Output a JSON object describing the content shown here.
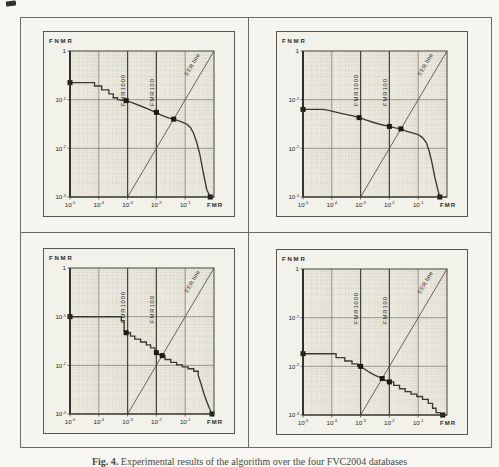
{
  "page": {
    "caption": {
      "label": "Fig. 4.",
      "text": "Experimental results of the algorithm over the four FVC2004 databases"
    }
  },
  "axes": {
    "ylabel": "FNMR",
    "xlabel": "FMR",
    "xscale": "log",
    "yscale": "log",
    "x_tick_exponents": [
      -5,
      -4,
      -3,
      -2,
      -1
    ],
    "y_tick_exponents": [
      0,
      -1,
      -2,
      -3
    ],
    "xlim_log": [
      -5,
      0
    ],
    "ylim_log": [
      -3,
      0
    ],
    "threshold_lines": [
      {
        "label": "FMR1000",
        "x_log": -3
      },
      {
        "label": "FMR100",
        "x_log": -2
      }
    ],
    "eer_label": "EER line",
    "grid": "log minor dotted, major solid",
    "colors": {
      "plot_bg": "#eae8dd",
      "frame_bg": "#f2f1ea",
      "minor_grid": "#b4b2a6",
      "major_grid": "#807e76",
      "threshold": "#45443e",
      "eer_line": "#55544c",
      "curve": "#3a3933",
      "marker": "#1b1a17",
      "axis": "#46453f",
      "axis_strong": "#2c2b27",
      "text": "#2c2b26"
    }
  },
  "chart_data": [
    {
      "name": "plot-top-left",
      "type": "line",
      "xlabel": "FMR",
      "ylabel": "FNMR",
      "xlim": [
        1e-05,
        1
      ],
      "ylim": [
        0.001,
        1
      ],
      "key_points": {
        "zerofmr_fnmr": 0.22,
        "fmr1000_fnmr": 0.095,
        "fmr100_fnmr": 0.055,
        "eer": 0.04,
        "zerofnmr_fmr": 0.74
      },
      "curve_log10": [
        [
          -5,
          0
        ],
        [
          -5,
          -0.65
        ],
        [
          -4.15,
          -0.65
        ],
        [
          -4.15,
          -0.72
        ],
        [
          -3.9,
          -0.72
        ],
        [
          -3.9,
          -0.8
        ],
        [
          -3.65,
          -0.8
        ],
        [
          -3.65,
          -0.88
        ],
        [
          -3.5,
          -0.88
        ],
        [
          -3.5,
          -0.96
        ],
        [
          -3.35,
          -0.96
        ],
        [
          -3.35,
          -1.0
        ],
        [
          -3.05,
          -1.02
        ],
        [
          -2.8,
          -1.07
        ],
        [
          -2.55,
          -1.13
        ],
        [
          -2.3,
          -1.19
        ],
        [
          -2.1,
          -1.24
        ],
        [
          -2.0,
          -1.26
        ],
        [
          -1.85,
          -1.31
        ],
        [
          -1.7,
          -1.35
        ],
        [
          -1.55,
          -1.38
        ],
        [
          -1.4,
          -1.4
        ],
        [
          -1.25,
          -1.43
        ],
        [
          -1.1,
          -1.46
        ],
        [
          -0.95,
          -1.5
        ],
        [
          -0.82,
          -1.57
        ],
        [
          -0.7,
          -1.7
        ],
        [
          -0.6,
          -1.88
        ],
        [
          -0.5,
          -2.1
        ],
        [
          -0.42,
          -2.35
        ],
        [
          -0.33,
          -2.62
        ],
        [
          -0.25,
          -2.85
        ],
        [
          -0.13,
          -3.0
        ]
      ],
      "markers_log10": [
        [
          -5,
          -0.65
        ],
        [
          -3.05,
          -1.02
        ],
        [
          -2.0,
          -1.26
        ],
        [
          -1.4,
          -1.4
        ],
        [
          -0.13,
          -3.0
        ]
      ]
    },
    {
      "name": "plot-top-right",
      "type": "line",
      "xlabel": "FMR",
      "ylabel": "FNMR",
      "xlim": [
        1e-05,
        1
      ],
      "ylim": [
        0.001,
        1
      ],
      "key_points": {
        "zerofmr_fnmr": 0.063,
        "fmr1000_fnmr": 0.043,
        "fmr100_fnmr": 0.028,
        "eer": 0.025,
        "zerofnmr_fmr": 0.56
      },
      "curve_log10": [
        [
          -5,
          0
        ],
        [
          -5,
          -1.2
        ],
        [
          -4.3,
          -1.2
        ],
        [
          -4.1,
          -1.22
        ],
        [
          -3.9,
          -1.25
        ],
        [
          -3.6,
          -1.29
        ],
        [
          -3.3,
          -1.33
        ],
        [
          -3.05,
          -1.37
        ],
        [
          -2.8,
          -1.42
        ],
        [
          -2.55,
          -1.47
        ],
        [
          -2.3,
          -1.51
        ],
        [
          -2.0,
          -1.55
        ],
        [
          -1.8,
          -1.58
        ],
        [
          -1.6,
          -1.6
        ],
        [
          -1.4,
          -1.65
        ],
        [
          -1.2,
          -1.68
        ],
        [
          -1.0,
          -1.72
        ],
        [
          -0.85,
          -1.78
        ],
        [
          -0.72,
          -1.88
        ],
        [
          -0.62,
          -2.05
        ],
        [
          -0.52,
          -2.3
        ],
        [
          -0.42,
          -2.6
        ],
        [
          -0.32,
          -2.85
        ],
        [
          -0.25,
          -3.0
        ]
      ],
      "markers_log10": [
        [
          -5,
          -1.2
        ],
        [
          -3.05,
          -1.37
        ],
        [
          -2.0,
          -1.55
        ],
        [
          -1.6,
          -1.6
        ],
        [
          -0.25,
          -3.0
        ]
      ]
    },
    {
      "name": "plot-bottom-left",
      "type": "line",
      "xlabel": "FMR",
      "ylabel": "FNMR",
      "xlim": [
        1e-05,
        1
      ],
      "ylim": [
        0.001,
        1
      ],
      "key_points": {
        "zerofmr_fnmr": 0.1,
        "fmr1000_fnmr": 0.047,
        "fmr100_fnmr": 0.018,
        "eer": 0.016,
        "zerofnmr_fmr": 0.85
      },
      "curve_log10": [
        [
          -5,
          0
        ],
        [
          -5,
          -1.0
        ],
        [
          -3.22,
          -1.0
        ],
        [
          -3.22,
          -1.08
        ],
        [
          -3.12,
          -1.08
        ],
        [
          -3.12,
          -1.3
        ],
        [
          -3.05,
          -1.33
        ],
        [
          -2.9,
          -1.33
        ],
        [
          -2.9,
          -1.4
        ],
        [
          -2.75,
          -1.4
        ],
        [
          -2.75,
          -1.46
        ],
        [
          -2.55,
          -1.46
        ],
        [
          -2.55,
          -1.52
        ],
        [
          -2.35,
          -1.52
        ],
        [
          -2.35,
          -1.58
        ],
        [
          -2.2,
          -1.58
        ],
        [
          -2.2,
          -1.64
        ],
        [
          -2.05,
          -1.64
        ],
        [
          -2.05,
          -1.72
        ],
        [
          -2.0,
          -1.74
        ],
        [
          -1.9,
          -1.78
        ],
        [
          -1.8,
          -1.8
        ],
        [
          -1.7,
          -1.8
        ],
        [
          -1.7,
          -1.88
        ],
        [
          -1.5,
          -1.88
        ],
        [
          -1.5,
          -1.94
        ],
        [
          -1.3,
          -1.94
        ],
        [
          -1.3,
          -1.99
        ],
        [
          -1.1,
          -1.99
        ],
        [
          -1.1,
          -2.03
        ],
        [
          -0.9,
          -2.03
        ],
        [
          -0.9,
          -2.07
        ],
        [
          -0.7,
          -2.07
        ],
        [
          -0.7,
          -2.12
        ],
        [
          -0.55,
          -2.12
        ],
        [
          -0.55,
          -2.2
        ],
        [
          -0.45,
          -2.38
        ],
        [
          -0.35,
          -2.58
        ],
        [
          -0.25,
          -2.75
        ],
        [
          -0.15,
          -2.9
        ],
        [
          -0.07,
          -3.0
        ]
      ],
      "markers_log10": [
        [
          -5,
          -1.0
        ],
        [
          -3.05,
          -1.33
        ],
        [
          -2.0,
          -1.74
        ],
        [
          -1.8,
          -1.8
        ],
        [
          -0.07,
          -3.0
        ]
      ]
    },
    {
      "name": "plot-bottom-right",
      "type": "line",
      "xlabel": "FMR",
      "ylabel": "FNMR",
      "xlim": [
        1e-05,
        1
      ],
      "ylim": [
        0.001,
        1
      ],
      "key_points": {
        "zerofmr_fnmr": 0.018,
        "fmr1000_fnmr": 0.01,
        "fmr100_fnmr": 0.0048,
        "eer": 0.0056,
        "zerofnmr_fmr": 0.7
      },
      "curve_log10": [
        [
          -5,
          0
        ],
        [
          -5,
          -1.74
        ],
        [
          -3.85,
          -1.74
        ],
        [
          -3.85,
          -1.82
        ],
        [
          -3.55,
          -1.82
        ],
        [
          -3.55,
          -1.89
        ],
        [
          -3.3,
          -1.89
        ],
        [
          -3.3,
          -1.95
        ],
        [
          -3.1,
          -1.95
        ],
        [
          -3.1,
          -2.0
        ],
        [
          -3.0,
          -2.0
        ],
        [
          -2.85,
          -2.06
        ],
        [
          -2.7,
          -2.12
        ],
        [
          -2.55,
          -2.17
        ],
        [
          -2.4,
          -2.21
        ],
        [
          -2.25,
          -2.25
        ],
        [
          -2.1,
          -2.3
        ],
        [
          -2.0,
          -2.32
        ],
        [
          -1.85,
          -2.32
        ],
        [
          -1.85,
          -2.39
        ],
        [
          -1.65,
          -2.39
        ],
        [
          -1.65,
          -2.46
        ],
        [
          -1.45,
          -2.46
        ],
        [
          -1.45,
          -2.52
        ],
        [
          -1.25,
          -2.52
        ],
        [
          -1.25,
          -2.57
        ],
        [
          -1.05,
          -2.57
        ],
        [
          -1.05,
          -2.62
        ],
        [
          -0.85,
          -2.62
        ],
        [
          -0.85,
          -2.68
        ],
        [
          -0.65,
          -2.68
        ],
        [
          -0.65,
          -2.76
        ],
        [
          -0.5,
          -2.76
        ],
        [
          -0.5,
          -2.86
        ],
        [
          -0.38,
          -2.86
        ],
        [
          -0.38,
          -2.95
        ],
        [
          -0.25,
          -2.95
        ],
        [
          -0.15,
          -3.0
        ]
      ],
      "markers_log10": [
        [
          -5,
          -1.74
        ],
        [
          -3.0,
          -2.0
        ],
        [
          -2.25,
          -2.25
        ],
        [
          -2.0,
          -2.32
        ],
        [
          -0.15,
          -3.0
        ]
      ]
    }
  ]
}
